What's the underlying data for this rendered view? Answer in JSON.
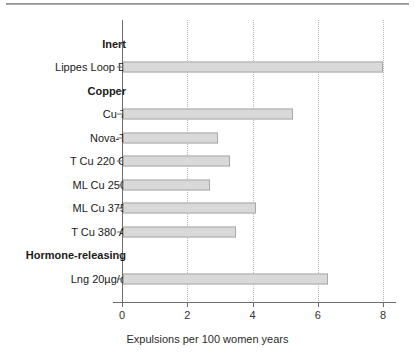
{
  "chart_data": {
    "type": "bar",
    "orientation": "horizontal",
    "title": "",
    "xlabel": "Expulsions per 100 women years",
    "ylabel": "",
    "xlim": [
      0,
      8
    ],
    "xticks": [
      0,
      2,
      4,
      6,
      8
    ],
    "xticklabels": [
      "0",
      "2",
      "4",
      "6",
      "8"
    ],
    "grid": "vertical-dotted",
    "legend": "none",
    "bar_color": "#d9d9d9",
    "bar_edge_color": "#a9a9a9",
    "axis_color": "#6e6e6e",
    "gridline_color": "#b9b9b9",
    "rows": [
      {
        "kind": "group",
        "label": "Inert",
        "value": null
      },
      {
        "kind": "bar",
        "label": "Lippes Loop D",
        "value": 8.0
      },
      {
        "kind": "group",
        "label": "Copper",
        "value": null
      },
      {
        "kind": "bar",
        "label": "Cu 7",
        "value": 5.25
      },
      {
        "kind": "bar",
        "label": "Nova-T",
        "value": 2.95
      },
      {
        "kind": "bar",
        "label": "T Cu 220 C",
        "value": 3.3
      },
      {
        "kind": "bar",
        "label": "ML Cu 250",
        "value": 2.7
      },
      {
        "kind": "bar",
        "label": "ML Cu 375",
        "value": 4.1
      },
      {
        "kind": "bar",
        "label": "T Cu 380 A",
        "value": 3.5
      },
      {
        "kind": "group",
        "label": "Hormone-releasing",
        "value": null
      },
      {
        "kind": "bar",
        "label": "Lng 20µg/d",
        "value": 6.3
      }
    ],
    "categories": [
      "Lippes Loop D",
      "Cu 7",
      "Nova-T",
      "T Cu 220 C",
      "ML Cu 250",
      "ML Cu 375",
      "T Cu 380 A",
      "Lng 20µg/d"
    ],
    "values": [
      8.0,
      5.25,
      2.95,
      3.3,
      2.7,
      4.1,
      3.5,
      6.3
    ],
    "groups": [
      {
        "name": "Inert",
        "categories": [
          "Lippes Loop D"
        ]
      },
      {
        "name": "Copper",
        "categories": [
          "Cu 7",
          "Nova-T",
          "T Cu 220 C",
          "ML Cu 250",
          "ML Cu 375",
          "T Cu 380 A"
        ]
      },
      {
        "name": "Hormone-releasing",
        "categories": [
          "Lng 20µg/d"
        ]
      }
    ]
  }
}
